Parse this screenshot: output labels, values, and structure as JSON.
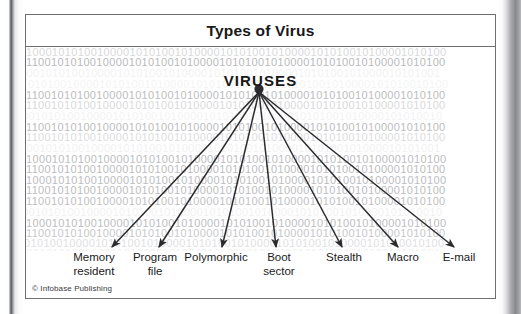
{
  "figure": {
    "title": "Types of Virus",
    "hub_label": "VIRUSES",
    "credit": "© Infobase Publishing",
    "frame_color": "#6e6f72",
    "arrow_color": "#2b2b2e",
    "code_color": "#b9babd",
    "background_color": "#ffffff"
  },
  "nodes": [
    {
      "label": "Memory\nresident",
      "center_x": 68,
      "tip_x": 86,
      "tip_y": 232
    },
    {
      "label": "Program\nfile",
      "center_x": 129,
      "tip_x": 133,
      "tip_y": 232
    },
    {
      "label": "Polymorphic",
      "center_x": 190,
      "tip_x": 196,
      "tip_y": 232
    },
    {
      "label": "Boot\nsector",
      "center_x": 253,
      "tip_x": 250,
      "tip_y": 232
    },
    {
      "label": "Stealth",
      "center_x": 318,
      "tip_x": 316,
      "tip_y": 232
    },
    {
      "label": "Macro",
      "center_x": 377,
      "tip_x": 372,
      "tip_y": 232
    },
    {
      "label": "E-mail",
      "center_x": 433,
      "tip_x": 428,
      "tip_y": 232
    }
  ],
  "hub": {
    "x": 233,
    "y": 74
  },
  "code_rows": [
    {
      "top": 0,
      "left": 0,
      "text": "10001010100100001010100101000010101001010000101010010100001010100",
      "opacity": 0.55
    },
    {
      "top": 10,
      "left": 0,
      "text": "11001010100100001010100101000010101001010000101010010100001010100",
      "opacity": 1.0
    },
    {
      "top": 21,
      "left": -6,
      "text": "10010101001000010101001010000101010010100001010100101000010101001",
      "opacity": 0.2
    },
    {
      "top": 32,
      "left": 2,
      "text": "01010010000101010010100001010100101000010101001010000101010010100",
      "opacity": 0.16
    },
    {
      "top": 43,
      "left": 0,
      "text": "11001010100100001010100101000010101001010000101010010100001010100",
      "opacity": 0.95
    },
    {
      "top": 53,
      "left": 0,
      "text": "11001010100100001010100101000010101001010000101010010100001010100",
      "opacity": 0.55
    },
    {
      "top": 64,
      "left": -4,
      "text": "00101010010000101010010100001010100101000010101001010000101010010",
      "opacity": 0.18
    },
    {
      "top": 75,
      "left": 0,
      "text": "11001010100100001010100101000010101001010000101010010100001010100",
      "opacity": 0.95
    },
    {
      "top": 85,
      "left": 0,
      "text": "11001010100100001010100101000010101001010000101010010100001010100",
      "opacity": 0.5
    },
    {
      "top": 96,
      "left": -6,
      "text": "10010101001000010101001010000101010010100001010100101000010101001",
      "opacity": 0.2
    },
    {
      "top": 107,
      "left": 0,
      "text": "10001010100100001010100101000010101001010000101010010100001010100",
      "opacity": 0.95
    },
    {
      "top": 117,
      "left": 0,
      "text": "11001010100100001010100101000010101001010000101010010100001010100",
      "opacity": 0.95
    },
    {
      "top": 128,
      "left": 0,
      "text": "10001010100100001010100101000010101001010000101010010100001010100",
      "opacity": 0.95
    },
    {
      "top": 138,
      "left": 0,
      "text": "11001010100100001010100101000010101001010000101010010100001010100",
      "opacity": 0.95
    },
    {
      "top": 149,
      "left": 0,
      "text": "11001010100100001010100101000010101001010000101010010100001010100",
      "opacity": 0.9
    },
    {
      "top": 160,
      "left": -4,
      "text": "00101010010000101010010100001010100101000010101001010000101010010",
      "opacity": 0.2
    },
    {
      "top": 171,
      "left": 0,
      "text": "10001010100100001010100101000010101001010000101010010100001010100",
      "opacity": 0.95
    },
    {
      "top": 181,
      "left": 0,
      "text": "11001010100100001010100101000010101001010000101010010100001010100",
      "opacity": 0.8
    },
    {
      "top": 191,
      "left": -2,
      "text": "01010010000101010010100001010100101000010101001010000101010010100",
      "opacity": 0.45
    },
    {
      "top": 201,
      "left": -6,
      "text": "10010101001000010101001010000101010010100001010100101000010101001",
      "opacity": 0.22
    }
  ]
}
